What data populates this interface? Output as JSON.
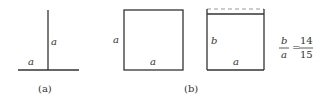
{
  "figure_a": {
    "caption": "(a)",
    "vertical_label": "a",
    "horizontal_label": "a"
  },
  "figure_b": {
    "caption": "(b)",
    "square": {
      "left_label": "a",
      "bottom_label": "a"
    },
    "rect": {
      "left_label": "b",
      "bottom_label": "a"
    },
    "ratio": {
      "lhs_num": "b",
      "lhs_den": "a",
      "equals": "=",
      "rhs_num": "14",
      "rhs_den": "15"
    }
  },
  "colors": {
    "line": "#333333",
    "dash": "#999999"
  }
}
